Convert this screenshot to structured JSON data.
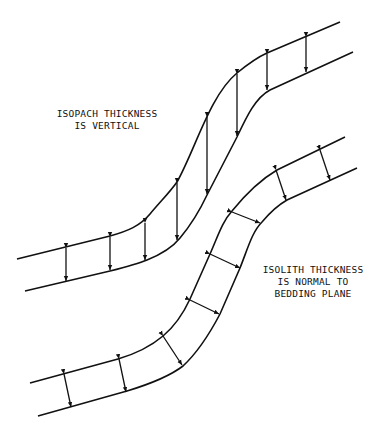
{
  "diagram": {
    "colors": {
      "line": "#111111",
      "background": "#ffffff"
    },
    "labels": {
      "isopach": {
        "line1": "ISOPACH THICKNESS",
        "line2": "IS VERTICAL"
      },
      "isolith": {
        "line1": "ISOLITH THICKNESS",
        "line2": "IS NORMAL TO",
        "line3": "BEDDING PLANE"
      }
    },
    "bands": [
      {
        "name": "upper-bed",
        "measurement": "vertical",
        "arrow_count": 7
      },
      {
        "name": "lower-bed",
        "measurement": "normal-to-bedding",
        "arrow_count": 8
      }
    ]
  }
}
